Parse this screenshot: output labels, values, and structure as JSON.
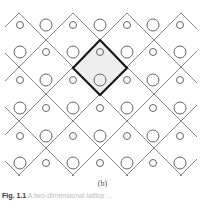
{
  "figure": {
    "sublabel": "(b)",
    "caption_prefix": "Fig. 1.1",
    "caption_text": "A two-dimensional lattice ...",
    "colors": {
      "lines": "#777777",
      "unit_cell_border": "#1a1a1a",
      "unit_cell_fill": "#eeeeee",
      "circles": "#666666"
    },
    "lattice": {
      "row_y": [
        25,
        52,
        80,
        108,
        136,
        163
      ],
      "col_x": [
        20,
        46,
        73,
        100,
        127,
        153,
        180
      ],
      "rows": [
        [
          "s",
          "L",
          "s",
          "L",
          "s",
          "L",
          "s"
        ],
        [
          "L",
          "s",
          "L",
          "s",
          "L",
          "s",
          "L"
        ],
        [
          "s",
          "L",
          "s",
          "L",
          "s",
          "L",
          "s"
        ],
        [
          "L",
          "s",
          "L",
          "s",
          "L",
          "s",
          "L"
        ],
        [
          "s",
          "L",
          "s",
          "L",
          "s",
          "L",
          "s"
        ],
        [
          "L",
          "s",
          "L",
          "s",
          "L",
          "s",
          "L"
        ]
      ],
      "large_radius": 6,
      "small_radius": 3.5
    },
    "unit_cell": {
      "top": [
        100,
        40
      ],
      "right": [
        127,
        68
      ],
      "bottom": [
        100,
        95
      ],
      "left": [
        73,
        68
      ]
    }
  }
}
